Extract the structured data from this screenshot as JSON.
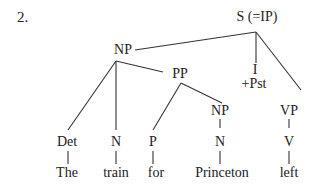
{
  "example_number": "2.",
  "nodes": {
    "s": "S (=IP)",
    "np_subject": "NP",
    "pp": "PP",
    "i": "I",
    "i_feature": "+Pst",
    "np_object": "NP",
    "vp": "VP",
    "det": "Det",
    "n_subject": "N",
    "p": "P",
    "n_object": "N",
    "v": "V"
  },
  "words": {
    "the": "The",
    "train": "train",
    "for": "for",
    "princeton": "Princeton",
    "left": "left"
  }
}
